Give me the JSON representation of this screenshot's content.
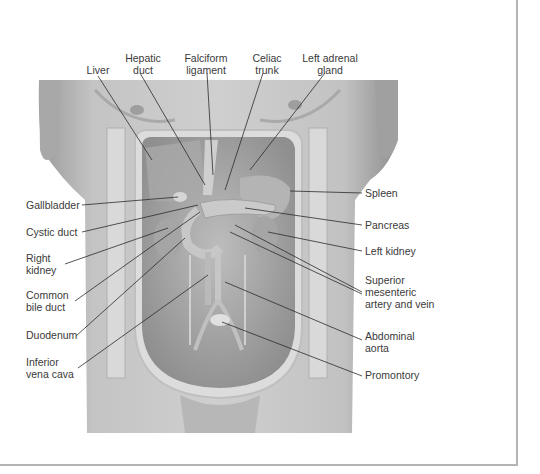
{
  "figure": {
    "frame_color": "#b4b4b4",
    "background": "#ffffff"
  },
  "labels": {
    "top": [
      {
        "id": "liver",
        "lines": [
          "Liver"
        ]
      },
      {
        "id": "hepatic-duct",
        "lines": [
          "Hepatic",
          "duct"
        ]
      },
      {
        "id": "falciform-ligament",
        "lines": [
          "Falciform",
          "ligament"
        ]
      },
      {
        "id": "celiac-trunk",
        "lines": [
          "Celiac",
          "trunk"
        ]
      },
      {
        "id": "left-adrenal-gland",
        "lines": [
          "Left adrenal",
          "gland"
        ]
      }
    ],
    "left": [
      {
        "id": "gallbladder",
        "lines": [
          "Gallbladder"
        ]
      },
      {
        "id": "cystic-duct",
        "lines": [
          "Cystic duct"
        ]
      },
      {
        "id": "right-kidney",
        "lines": [
          "Right",
          "kidney"
        ]
      },
      {
        "id": "common-bile-duct",
        "lines": [
          "Common",
          "bile duct"
        ]
      },
      {
        "id": "duodenum",
        "lines": [
          "Duodenum"
        ]
      },
      {
        "id": "inferior-vena-cava",
        "lines": [
          "Inferior",
          "vena cava"
        ]
      }
    ],
    "right": [
      {
        "id": "spleen",
        "lines": [
          "Spleen"
        ]
      },
      {
        "id": "pancreas",
        "lines": [
          "Pancreas"
        ]
      },
      {
        "id": "left-kidney",
        "lines": [
          "Left kidney"
        ]
      },
      {
        "id": "superior-mesenteric",
        "lines": [
          "Superior",
          "mesenteric",
          "artery and vein"
        ]
      },
      {
        "id": "abdominal-aorta",
        "lines": [
          "Abdominal",
          "aorta"
        ]
      },
      {
        "id": "promontory",
        "lines": [
          "Promontory"
        ]
      }
    ]
  }
}
